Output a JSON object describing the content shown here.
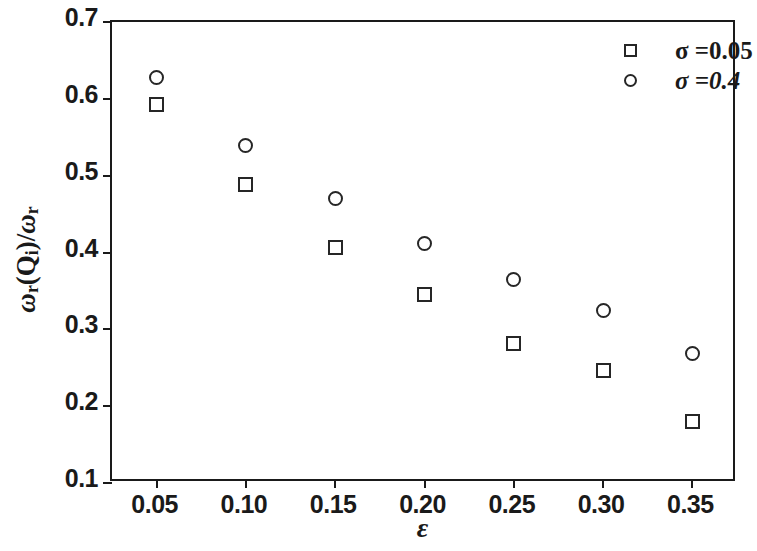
{
  "chart_data": {
    "type": "scatter",
    "title": "",
    "xlabel": "ε",
    "ylabel": "ωr(Qi)/ωr",
    "xlim": [
      0.025,
      0.375
    ],
    "ylim": [
      0.1,
      0.7
    ],
    "grid": false,
    "legend_position": "top-right",
    "x": [
      0.05,
      0.1,
      0.15,
      0.2,
      0.25,
      0.3,
      0.35
    ],
    "xticks": [
      "0.05",
      "0.10",
      "0.15",
      "0.20",
      "0.25",
      "0.30",
      "0.35"
    ],
    "xtick_values": [
      0.05,
      0.1,
      0.15,
      0.2,
      0.25,
      0.3,
      0.35
    ],
    "yticks": [
      "0.1",
      "0.2",
      "0.3",
      "0.4",
      "0.5",
      "0.6",
      "0.7"
    ],
    "ytick_values": [
      0.1,
      0.2,
      0.3,
      0.4,
      0.5,
      0.6,
      0.7
    ],
    "series": [
      {
        "name": "σ =0.05",
        "marker": "square",
        "values": [
          0.593,
          0.488,
          0.406,
          0.345,
          0.282,
          0.246,
          0.18
        ]
      },
      {
        "name": "σ =0.4",
        "marker": "circle",
        "values": [
          0.628,
          0.539,
          0.47,
          0.412,
          0.365,
          0.324,
          0.268
        ]
      }
    ]
  },
  "axis": {
    "y_label_parts": {
      "omega1": "ω",
      "sub_r1": "r",
      "open": "(Q",
      "sub_i": "i",
      "close": ")/",
      "omega2": "ω",
      "sub_r2": "r"
    },
    "x_label": "ε"
  },
  "legend": {
    "entries": [
      {
        "marker": "square-marker",
        "label": "σ =0.05"
      },
      {
        "marker": "circle-marker",
        "label": "σ =0.4"
      }
    ]
  },
  "colors": {
    "axis": "#1a1a1a",
    "marker": "#262626",
    "background": "#ffffff"
  }
}
